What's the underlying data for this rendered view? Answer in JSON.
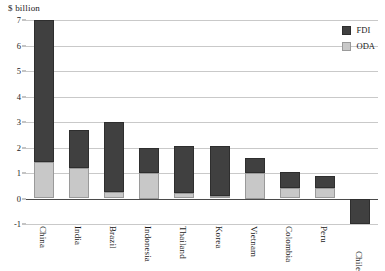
{
  "chart_data": {
    "type": "bar",
    "stacked": true,
    "title": "",
    "subtitle": "",
    "unit_caption": "$ billion",
    "xlabel": "",
    "ylabel": "",
    "ylim": [
      -1,
      7
    ],
    "yticks": [
      -1,
      0,
      1,
      2,
      3,
      4,
      5,
      6,
      7
    ],
    "ytick_labels": [
      "-1",
      "0",
      "1",
      "2",
      "3",
      "4",
      "5",
      "6",
      "7"
    ],
    "grid": true,
    "legend_position": "top-right",
    "categories": [
      "China",
      "India",
      "Brazil",
      "Indonesia",
      "Thailand",
      "Korea",
      "Vietnam",
      "Colombia",
      "Peru",
      "Chile"
    ],
    "series": [
      {
        "name": "ODA",
        "color": "#c8c8c8",
        "values": [
          1.45,
          1.2,
          0.27,
          1.0,
          0.23,
          0.1,
          1.0,
          0.43,
          0.4,
          0
        ]
      },
      {
        "name": "FDI",
        "color": "#404040",
        "values": [
          5.55,
          1.5,
          2.73,
          1.0,
          1.82,
          1.95,
          0.6,
          0.62,
          0.5,
          -1.0
        ]
      }
    ],
    "totals": [
      7.0,
      2.7,
      3.0,
      2.0,
      2.05,
      2.05,
      1.6,
      1.05,
      0.9,
      -1.0
    ]
  },
  "legend": {
    "entries": [
      {
        "label": "FDI",
        "color": "#404040",
        "swatch": "fdi"
      },
      {
        "label": "ODA",
        "color": "#c8c8c8",
        "swatch": "oda"
      }
    ]
  },
  "colors": {
    "fdi": "#404040",
    "oda": "#c8c8c8",
    "gridline": "#c9c9c9",
    "axis": "#4a4a4a",
    "background": "#ffffff",
    "text": "#1a1a1a"
  }
}
